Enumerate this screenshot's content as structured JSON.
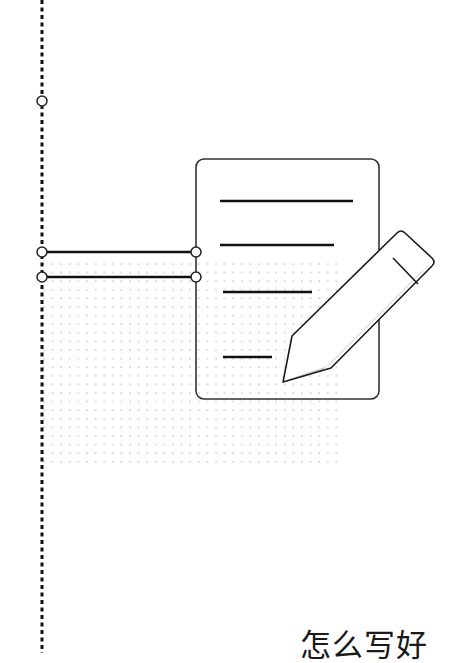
{
  "page": {
    "title_text": "怎么写好"
  },
  "illustration": {
    "subject": "document-with-pencil",
    "icons": [
      "document-icon",
      "pencil-icon"
    ],
    "document_lines": 4,
    "colors": {
      "stroke": "#1a1a1a",
      "outline": "#333333",
      "dot_grid": "#c8c8c8",
      "pencil_shade": "#c9c9c9",
      "background": "#ffffff"
    }
  }
}
